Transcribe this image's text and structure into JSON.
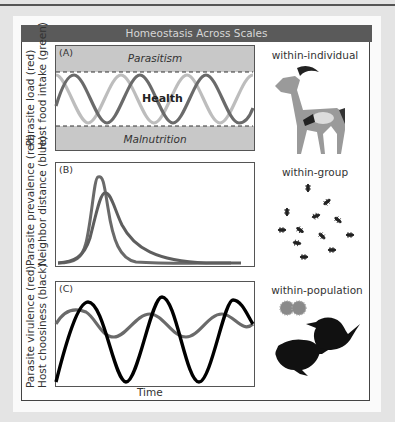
{
  "title": "Homeostasis Across Scales",
  "panels": [
    {
      "id": "A",
      "label": "(A)",
      "ylabel_line1": "Parasite load (red)",
      "ylabel_line2": "Host food intake (green)",
      "top_band": "Parasitism",
      "bottom_band": "Malnutrition",
      "center_text": "Health",
      "scale": "within-individual",
      "illustration": "gazelle"
    },
    {
      "id": "B",
      "label": "(B)",
      "ylabel_line1": "Parasite prevalence (red)",
      "ylabel_line2": "Neighbor distance (blue)",
      "scale": "within-group",
      "illustration": "ants"
    },
    {
      "id": "C",
      "label": "(C)",
      "ylabel_line1": "Parasite virulence (red)",
      "ylabel_line2": "Host choosiness (black)",
      "xlabel": "Time",
      "scale": "within-population",
      "illustration": "birds-and-parasite"
    }
  ],
  "colors": {
    "title_bg": "#5a5a5a",
    "band": "#c8c8c8",
    "curve_red": "#6a6a6a",
    "curve_green": "#bdbdbd",
    "curve_black": "#000000"
  }
}
